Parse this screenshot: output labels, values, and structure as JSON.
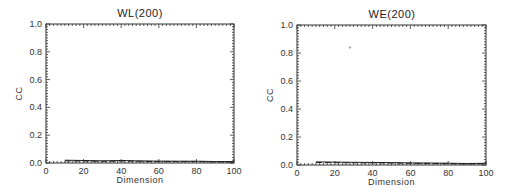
{
  "chart_data": [
    {
      "type": "line",
      "title": "WL(200)",
      "xlabel": "Dimension",
      "ylabel": "CC",
      "xlim": [
        0,
        100
      ],
      "ylim": [
        0.0,
        1.0
      ],
      "xticks": [
        "0",
        "20",
        "40",
        "60",
        "80",
        "100"
      ],
      "yticks": [
        "0.0",
        "0.2",
        "0.4",
        "0.6",
        "0.8",
        "1.0"
      ],
      "grid": false,
      "series": [
        {
          "name": "solid",
          "style": "solid",
          "x": [
            10,
            20,
            30,
            40,
            50,
            60,
            70,
            80,
            90,
            100
          ],
          "values": [
            0.02,
            0.018,
            0.016,
            0.018,
            0.015,
            0.014,
            0.013,
            0.013,
            0.011,
            0.01
          ]
        },
        {
          "name": "dashed",
          "style": "dashed",
          "x": [
            10,
            20,
            30,
            40,
            50,
            60,
            70,
            80,
            90,
            100
          ],
          "values": [
            0.015,
            0.014,
            0.012,
            0.014,
            0.012,
            0.01,
            0.01,
            0.011,
            0.008,
            0.007
          ]
        }
      ]
    },
    {
      "type": "line",
      "title": "WE(200)",
      "xlabel": "Dimension",
      "ylabel": "CC",
      "xlim": [
        0,
        100
      ],
      "ylim": [
        0.0,
        1.0
      ],
      "xticks": [
        "0",
        "20",
        "40",
        "60",
        "80",
        "100"
      ],
      "yticks": [
        "0.0",
        "0.2",
        "0.4",
        "0.6",
        "0.8",
        "1.0"
      ],
      "grid": false,
      "annotations": [
        {
          "type": "dot",
          "x": 28,
          "y": 0.84
        }
      ],
      "series": [
        {
          "name": "solid",
          "style": "solid",
          "x": [
            10,
            20,
            30,
            40,
            50,
            60,
            70,
            80,
            90,
            100
          ],
          "values": [
            0.022,
            0.021,
            0.019,
            0.018,
            0.017,
            0.015,
            0.014,
            0.013,
            0.011,
            0.012
          ]
        },
        {
          "name": "dashed",
          "style": "dashed",
          "x": [
            10,
            20,
            30,
            40,
            50,
            60,
            70,
            80,
            90,
            100
          ],
          "values": [
            0.018,
            0.017,
            0.016,
            0.015,
            0.014,
            0.012,
            0.011,
            0.01,
            0.007,
            0.009
          ]
        }
      ]
    }
  ],
  "layout": {
    "plots": [
      {
        "left": 46,
        "top": 24,
        "right": 234,
        "bottom": 163,
        "title_x": 140
      },
      {
        "left": 297,
        "top": 25,
        "right": 486,
        "bottom": 165,
        "title_x": 392
      }
    ],
    "colors": {
      "axis": "#333333",
      "line": "#222222",
      "text": "#333333",
      "dot": "#aaaaaa"
    }
  }
}
